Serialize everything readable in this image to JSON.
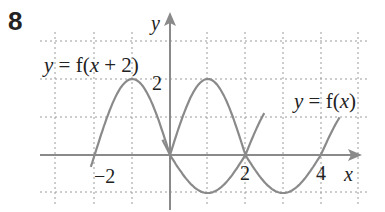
{
  "question_number": "8",
  "chart_data": {
    "type": "line",
    "title": "",
    "xlabel": "x",
    "ylabel": "y",
    "x_tick_labels": [
      {
        "value": -2,
        "label": "−2"
      },
      {
        "value": 2,
        "label": "2"
      },
      {
        "value": 4,
        "label": "4"
      }
    ],
    "y_tick_labels": [
      {
        "value": 2,
        "label": "2"
      }
    ],
    "xlim": [
      -3,
      5
    ],
    "ylim": [
      -1,
      3
    ],
    "grid": true,
    "grid_style": "dotted",
    "series": [
      {
        "name": "y = f(x + 2)",
        "x": [
          -2.1,
          -2,
          -1.5,
          -1,
          -0.5,
          0,
          0.5,
          1,
          1.5,
          2,
          2.5
        ],
        "y": [
          -0.6,
          0,
          1.41,
          2,
          1.41,
          0,
          1.41,
          2,
          1.41,
          0,
          1.1
        ]
      },
      {
        "name": "y = f(x)",
        "x": [
          -0.2,
          0,
          0.5,
          1,
          1.5,
          2,
          2.5,
          3,
          3.5,
          4,
          4.5
        ],
        "y": [
          0.6,
          0,
          -0.71,
          -1,
          -0.71,
          0,
          -0.71,
          -1,
          -0.71,
          0,
          1.0
        ]
      }
    ],
    "annotations": [
      {
        "text": "y = f(x + 2)",
        "series": 0
      },
      {
        "text": "y = f(x)",
        "series": 1
      }
    ],
    "colors": {
      "curve": "#8a8a8a",
      "axis": "#8a8a8a",
      "grid": "#9a9a9a",
      "text": "#222222"
    }
  },
  "labels": {
    "fx2_left": "y = f(",
    "fx2_x": "x",
    "fx2_right": " + 2)",
    "fx_left": "y = f(",
    "fx_x": "x",
    "fx_right": ")",
    "y_axis": "y",
    "x_axis": "x",
    "tick_neg2": "−2",
    "tick_2x": "2",
    "tick_4x": "4",
    "tick_2y": "2"
  }
}
